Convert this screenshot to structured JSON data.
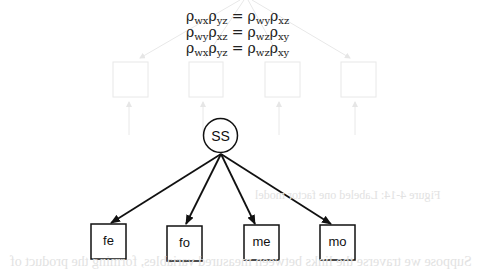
{
  "equations": [
    {
      "lhs": [
        {
          "base": "ρ",
          "sub": "wx"
        },
        {
          "base": "ρ",
          "sub": "yz"
        }
      ],
      "op": "=",
      "rhs": [
        {
          "base": "ρ",
          "sub": "wy"
        },
        {
          "base": "ρ",
          "sub": "xz"
        }
      ]
    },
    {
      "lhs": [
        {
          "base": "ρ",
          "sub": "wy"
        },
        {
          "base": "ρ",
          "sub": "xz"
        }
      ],
      "op": "=",
      "rhs": [
        {
          "base": "ρ",
          "sub": "wz"
        },
        {
          "base": "ρ",
          "sub": "xy"
        }
      ]
    },
    {
      "lhs": [
        {
          "base": "ρ",
          "sub": "wx"
        },
        {
          "base": "ρ",
          "sub": "yz"
        }
      ],
      "op": "=",
      "rhs": [
        {
          "base": "ρ",
          "sub": "wz"
        },
        {
          "base": "ρ",
          "sub": "xy"
        }
      ]
    }
  ],
  "latent": {
    "label": "SS"
  },
  "indicators": [
    {
      "label": "fe"
    },
    {
      "label": "fo"
    },
    {
      "label": "me"
    },
    {
      "label": "mo"
    }
  ],
  "ghost": {
    "caption": "Figure 4-14: Labeled one factor model",
    "paragraph": "Suppose we traverse the links between measured variables, forming the product of",
    "boxes": [
      "om",
      "em",
      "of",
      "ef"
    ]
  },
  "colors": {
    "ink": "#111111",
    "ghost": "#e4e4e4"
  }
}
